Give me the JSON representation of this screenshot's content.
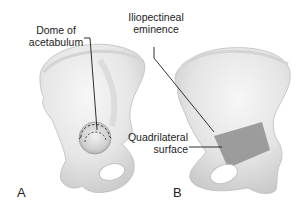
{
  "figure": {
    "panels": [
      {
        "letter": "A",
        "labels": [
          {
            "id": "dome",
            "line1": "Dome of",
            "line2": "acetabulum"
          }
        ]
      },
      {
        "letter": "B",
        "labels": [
          {
            "id": "iliopectineal",
            "line1": "Iliopectineal",
            "line2": "eminence"
          },
          {
            "id": "quadrilateral",
            "line1": "Quadrilateral",
            "line2": "surface"
          }
        ]
      }
    ],
    "colors": {
      "bone_fill": "#ececec",
      "bone_shadow": "#cfcfcf",
      "bone_outline": "#b8b8b8",
      "quadrilateral_fill": "#8e8e8e",
      "leader_line": "#1a1a1a",
      "background": "#ffffff"
    }
  }
}
